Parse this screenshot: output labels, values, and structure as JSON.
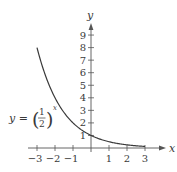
{
  "chart_data": {
    "type": "line",
    "title": "",
    "function_label": {
      "lhs": "y = ",
      "numerator": "1",
      "denominator": "2",
      "exponent": "x"
    },
    "xlabel": "x",
    "ylabel": "y",
    "xlim": [
      -3,
      3
    ],
    "ylim": [
      0,
      9
    ],
    "x_ticks": [
      -3,
      -2,
      -1,
      1,
      2,
      3
    ],
    "x_tick_labels": [
      "−3",
      "−2",
      "−1",
      "1",
      "2",
      "3"
    ],
    "y_ticks": [
      1,
      2,
      3,
      4,
      5,
      6,
      7,
      8,
      9
    ],
    "y_tick_labels": [
      "1",
      "2",
      "3",
      "4",
      "5",
      "6",
      "7",
      "8",
      "9"
    ],
    "grid": false,
    "series": [
      {
        "name": "y = (1/2)^x",
        "x": [
          -3,
          -2.5,
          -2,
          -1.5,
          -1,
          -0.5,
          0,
          0.5,
          1,
          1.5,
          2,
          2.5,
          3
        ],
        "y": [
          8,
          5.657,
          4,
          2.828,
          2,
          1.414,
          1,
          0.707,
          0.5,
          0.354,
          0.25,
          0.177,
          0.125
        ]
      }
    ],
    "colors": {
      "axis": "#555555",
      "curve": "#3a3a3a",
      "text": "#3a3a3a"
    }
  }
}
